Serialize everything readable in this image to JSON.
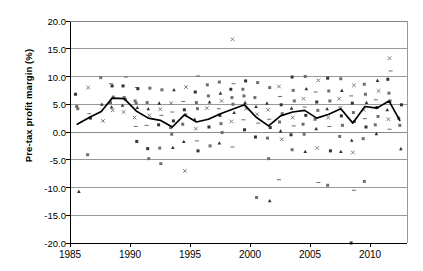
{
  "chart": {
    "title": "",
    "ylabel": "Pre-tax profit margin (%)",
    "xlabel": ""
  },
  "chart_data": {
    "type": "scatter",
    "title": "",
    "xlabel": "",
    "ylabel": "Pre-tax profit margin (%)",
    "xlim": [
      1985,
      2013
    ],
    "ylim": [
      -20.0,
      20.0
    ],
    "grid": "horizontal",
    "legend": "none",
    "yticks": [
      "20.0",
      "15.0",
      "10.0",
      "5.0",
      "0.0",
      "-5.0",
      "-10.0",
      "-15.0",
      "-20.0"
    ],
    "ytick_values": [
      20.0,
      15.0,
      10.0,
      5.0,
      0.0,
      -5.0,
      -10.0,
      -15.0,
      -20.0
    ],
    "xticks": [
      "1985",
      "1990",
      "1995",
      "2000",
      "2005",
      "2010"
    ],
    "xtick_values": [
      1985,
      1990,
      1995,
      2000,
      2005,
      2010
    ],
    "series": [
      {
        "name": "Mean pre-tax profit margin",
        "type": "line",
        "color": "#000000",
        "x": [
          1985.6,
          1986.6,
          1987.6,
          1988.5,
          1989.5,
          1990.5,
          1991.5,
          1992.5,
          1993.5,
          1994.5,
          1995.5,
          1996.5,
          1997.5,
          1998.5,
          1999.5,
          2000.5,
          2001.5,
          2002.5,
          2003.5,
          2004.5,
          2005.5,
          2006.5,
          2007.5,
          2008.5,
          2009.5,
          2010.5,
          2011.5,
          2012.4
        ],
        "values": [
          1.4,
          2.6,
          3.7,
          6.1,
          6.0,
          3.8,
          2.5,
          2.1,
          0.9,
          3.1,
          1.8,
          2.3,
          3.3,
          4.1,
          4.9,
          2.6,
          1.1,
          2.9,
          3.6,
          3.9,
          2.5,
          3.2,
          4.2,
          1.6,
          4.6,
          4.3,
          5.6,
          2.1
        ]
      },
      {
        "name": "Individual company observations",
        "type": "scatter",
        "color": "#555555",
        "points": [
          [
            1985.6,
            6.8
          ],
          [
            1985.6,
            4.6
          ],
          [
            1985.6,
            4.2
          ],
          [
            1985.6,
            -10.7
          ],
          [
            1986.6,
            8.0
          ],
          [
            1986.6,
            3.3
          ],
          [
            1986.6,
            2.5
          ],
          [
            1986.6,
            -4.1
          ],
          [
            1987.6,
            9.8
          ],
          [
            1987.6,
            5.0
          ],
          [
            1987.6,
            2.0
          ],
          [
            1988.5,
            8.7
          ],
          [
            1988.5,
            8.3
          ],
          [
            1988.5,
            6.3
          ],
          [
            1988.5,
            5.3
          ],
          [
            1988.5,
            4.5
          ],
          [
            1988.5,
            3.9
          ],
          [
            1989.5,
            9.9
          ],
          [
            1989.5,
            8.3
          ],
          [
            1989.5,
            6.2
          ],
          [
            1989.5,
            5.9
          ],
          [
            1989.5,
            4.8
          ],
          [
            1989.5,
            3.6
          ],
          [
            1990.5,
            8.0
          ],
          [
            1990.5,
            7.8
          ],
          [
            1990.5,
            5.6
          ],
          [
            1990.5,
            5.2
          ],
          [
            1990.5,
            4.4
          ],
          [
            1990.5,
            2.6
          ],
          [
            1990.5,
            1.0
          ],
          [
            1990.5,
            -1.7
          ],
          [
            1991.5,
            7.9
          ],
          [
            1991.5,
            5.3
          ],
          [
            1991.5,
            4.2
          ],
          [
            1991.5,
            3.0
          ],
          [
            1991.5,
            1.2
          ],
          [
            1991.5,
            -3.0
          ],
          [
            1991.5,
            -4.8
          ],
          [
            1992.5,
            7.6
          ],
          [
            1992.5,
            5.2
          ],
          [
            1992.5,
            4.1
          ],
          [
            1992.5,
            3.0
          ],
          [
            1992.5,
            1.3
          ],
          [
            1992.5,
            -2.9
          ],
          [
            1992.5,
            -5.7
          ],
          [
            1993.5,
            7.6
          ],
          [
            1993.5,
            5.2
          ],
          [
            1993.5,
            3.6
          ],
          [
            1993.5,
            2.0
          ],
          [
            1993.5,
            0.8
          ],
          [
            1993.5,
            -0.4
          ],
          [
            1993.5,
            -2.8
          ],
          [
            1994.5,
            8.1
          ],
          [
            1994.5,
            5.5
          ],
          [
            1994.5,
            4.0
          ],
          [
            1994.5,
            3.1
          ],
          [
            1994.5,
            1.4
          ],
          [
            1994.5,
            -1.7
          ],
          [
            1994.5,
            -7.0
          ],
          [
            1995.5,
            10.1
          ],
          [
            1995.5,
            7.2
          ],
          [
            1995.5,
            5.3
          ],
          [
            1995.5,
            4.2
          ],
          [
            1995.5,
            2.3
          ],
          [
            1995.5,
            0.6
          ],
          [
            1995.5,
            -1.6
          ],
          [
            1995.5,
            -3.4
          ],
          [
            1996.5,
            8.5
          ],
          [
            1996.5,
            6.5
          ],
          [
            1996.5,
            5.4
          ],
          [
            1996.5,
            4.3
          ],
          [
            1996.5,
            2.3
          ],
          [
            1996.5,
            0.9
          ],
          [
            1996.5,
            -2.5
          ],
          [
            1997.5,
            9.0
          ],
          [
            1997.5,
            7.0
          ],
          [
            1997.5,
            5.6
          ],
          [
            1997.5,
            4.2
          ],
          [
            1997.5,
            3.0
          ],
          [
            1997.5,
            1.5
          ],
          [
            1997.5,
            -0.1
          ],
          [
            1997.5,
            -2.0
          ],
          [
            1998.5,
            16.7
          ],
          [
            1998.5,
            8.7
          ],
          [
            1998.5,
            7.7
          ],
          [
            1998.5,
            6.2
          ],
          [
            1998.5,
            5.0
          ],
          [
            1998.5,
            3.5
          ],
          [
            1998.5,
            1.9
          ],
          [
            1998.5,
            -2.7
          ],
          [
            1999.5,
            9.2
          ],
          [
            1999.5,
            7.7
          ],
          [
            1999.5,
            6.5
          ],
          [
            1999.5,
            5.3
          ],
          [
            1999.5,
            4.2
          ],
          [
            1999.5,
            2.2
          ],
          [
            1999.5,
            0.4
          ],
          [
            2000.5,
            8.9
          ],
          [
            2000.5,
            6.2
          ],
          [
            2000.5,
            4.6
          ],
          [
            2000.5,
            3.2
          ],
          [
            2000.5,
            1.6
          ],
          [
            2000.5,
            -0.9
          ],
          [
            2000.5,
            -11.8
          ],
          [
            2001.5,
            8.0
          ],
          [
            2001.5,
            5.2
          ],
          [
            2001.5,
            4.0
          ],
          [
            2001.5,
            2.3
          ],
          [
            2001.5,
            0.8
          ],
          [
            2001.5,
            -1.1
          ],
          [
            2001.5,
            -4.8
          ],
          [
            2001.5,
            -12.4
          ],
          [
            2002.5,
            8.2
          ],
          [
            2002.5,
            6.4
          ],
          [
            2002.5,
            4.9
          ],
          [
            2002.5,
            3.3
          ],
          [
            2002.5,
            1.8
          ],
          [
            2002.5,
            0.2
          ],
          [
            2002.5,
            -1.3
          ],
          [
            2002.5,
            -8.6
          ],
          [
            2003.5,
            9.9
          ],
          [
            2003.5,
            7.5
          ],
          [
            2003.5,
            5.6
          ],
          [
            2003.5,
            4.3
          ],
          [
            2003.5,
            2.6
          ],
          [
            2003.5,
            1.1
          ],
          [
            2003.5,
            -0.5
          ],
          [
            2003.5,
            -3.2
          ],
          [
            2004.5,
            10.0
          ],
          [
            2004.5,
            7.8
          ],
          [
            2004.5,
            6.0
          ],
          [
            2004.5,
            4.5
          ],
          [
            2004.5,
            3.0
          ],
          [
            2004.5,
            1.4
          ],
          [
            2004.5,
            -0.4
          ],
          [
            2004.5,
            -3.5
          ],
          [
            2005.5,
            9.3
          ],
          [
            2005.5,
            7.2
          ],
          [
            2005.5,
            5.4
          ],
          [
            2005.5,
            3.9
          ],
          [
            2005.5,
            2.3
          ],
          [
            2005.5,
            0.6
          ],
          [
            2005.5,
            -2.9
          ],
          [
            2005.5,
            -9.1
          ],
          [
            2006.5,
            9.7
          ],
          [
            2006.5,
            7.4
          ],
          [
            2006.5,
            5.6
          ],
          [
            2006.5,
            4.2
          ],
          [
            2006.5,
            2.6
          ],
          [
            2006.5,
            1.0
          ],
          [
            2006.5,
            -3.4
          ],
          [
            2006.5,
            -9.6
          ],
          [
            2007.5,
            9.6
          ],
          [
            2007.5,
            7.5
          ],
          [
            2007.5,
            6.0
          ],
          [
            2007.5,
            4.5
          ],
          [
            2007.5,
            2.9
          ],
          [
            2007.5,
            1.2
          ],
          [
            2007.5,
            -0.8
          ],
          [
            2007.5,
            -3.5
          ],
          [
            2008.5,
            8.4
          ],
          [
            2008.5,
            6.5
          ],
          [
            2008.5,
            5.2
          ],
          [
            2008.5,
            3.5
          ],
          [
            2008.5,
            1.9
          ],
          [
            2008.5,
            -1.5
          ],
          [
            2008.5,
            -3.7
          ],
          [
            2008.5,
            -10.5
          ],
          [
            2008.5,
            -20.0
          ],
          [
            2009.5,
            8.6
          ],
          [
            2009.5,
            6.8
          ],
          [
            2009.5,
            5.3
          ],
          [
            2009.5,
            4.0
          ],
          [
            2009.5,
            2.4
          ],
          [
            2009.5,
            0.9
          ],
          [
            2009.5,
            -1.2
          ],
          [
            2009.5,
            -8.9
          ],
          [
            2010.5,
            9.3
          ],
          [
            2010.5,
            7.4
          ],
          [
            2010.5,
            5.8
          ],
          [
            2010.5,
            4.4
          ],
          [
            2010.5,
            2.8
          ],
          [
            2010.5,
            1.3
          ],
          [
            2010.5,
            -0.3
          ],
          [
            2011.5,
            13.3
          ],
          [
            2011.5,
            11.0
          ],
          [
            2011.5,
            9.5
          ],
          [
            2011.5,
            7.0
          ],
          [
            2011.5,
            5.6
          ],
          [
            2011.5,
            4.0
          ],
          [
            2011.5,
            2.3
          ],
          [
            2011.5,
            0.5
          ],
          [
            2012.4,
            4.9
          ],
          [
            2012.4,
            2.5
          ],
          [
            2012.4,
            1.2
          ],
          [
            2012.4,
            -3.0
          ]
        ]
      }
    ]
  },
  "colors": {
    "gridline": "#808080",
    "axis": "#000000",
    "trendline": "#000000",
    "marker": "#555555",
    "background": "#ffffff"
  }
}
